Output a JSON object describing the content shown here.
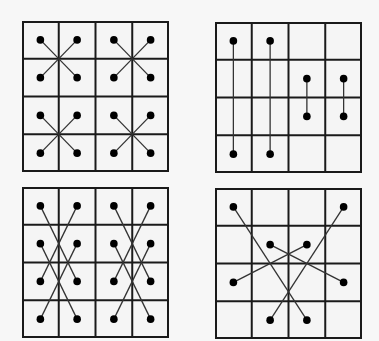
{
  "diagram": {
    "colors": {
      "background": "#f7f7f7",
      "cell_fill": "#f5f5f5",
      "grid_line": "#1a1a1a",
      "connector": "#333333",
      "dot": "#000000"
    },
    "grid": {
      "rows": 4,
      "cols": 4
    },
    "panels": [
      {
        "id": "top-left",
        "pattern": "crossing-X-pairs-within-2x2-blocks",
        "dots": [
          [
            0,
            0
          ],
          [
            1,
            0
          ],
          [
            2,
            0
          ],
          [
            3,
            0
          ],
          [
            0,
            1
          ],
          [
            1,
            1
          ],
          [
            2,
            1
          ],
          [
            3,
            1
          ],
          [
            0,
            2
          ],
          [
            1,
            2
          ],
          [
            2,
            2
          ],
          [
            3,
            2
          ],
          [
            0,
            3
          ],
          [
            1,
            3
          ],
          [
            2,
            3
          ],
          [
            3,
            3
          ]
        ],
        "edges": [
          [
            [
              0,
              0
            ],
            [
              1,
              1
            ]
          ],
          [
            [
              1,
              0
            ],
            [
              0,
              1
            ]
          ],
          [
            [
              2,
              0
            ],
            [
              3,
              1
            ]
          ],
          [
            [
              3,
              0
            ],
            [
              2,
              1
            ]
          ],
          [
            [
              0,
              2
            ],
            [
              1,
              3
            ]
          ],
          [
            [
              1,
              2
            ],
            [
              0,
              3
            ]
          ],
          [
            [
              2,
              2
            ],
            [
              3,
              3
            ]
          ],
          [
            [
              3,
              2
            ],
            [
              2,
              3
            ]
          ]
        ]
      },
      {
        "id": "top-right",
        "pattern": "vertical-pairs",
        "dots": [
          [
            0,
            0
          ],
          [
            1,
            0
          ],
          [
            2,
            1
          ],
          [
            3,
            1
          ],
          [
            2,
            2
          ],
          [
            3,
            2
          ],
          [
            0,
            3
          ],
          [
            1,
            3
          ]
        ],
        "edges": [
          [
            [
              0,
              0
            ],
            [
              0,
              3
            ]
          ],
          [
            [
              1,
              0
            ],
            [
              1,
              3
            ]
          ],
          [
            [
              2,
              1
            ],
            [
              2,
              2
            ]
          ],
          [
            [
              3,
              1
            ],
            [
              3,
              2
            ]
          ]
        ]
      },
      {
        "id": "bottom-left",
        "pattern": "crossing-pairs-skip-one-row",
        "dots": [
          [
            0,
            0
          ],
          [
            1,
            0
          ],
          [
            2,
            0
          ],
          [
            3,
            0
          ],
          [
            0,
            1
          ],
          [
            1,
            1
          ],
          [
            2,
            1
          ],
          [
            3,
            1
          ],
          [
            0,
            2
          ],
          [
            1,
            2
          ],
          [
            2,
            2
          ],
          [
            3,
            2
          ],
          [
            0,
            3
          ],
          [
            1,
            3
          ],
          [
            2,
            3
          ],
          [
            3,
            3
          ]
        ],
        "edges": [
          [
            [
              0,
              0
            ],
            [
              1,
              2
            ]
          ],
          [
            [
              1,
              0
            ],
            [
              0,
              2
            ]
          ],
          [
            [
              0,
              1
            ],
            [
              1,
              3
            ]
          ],
          [
            [
              1,
              1
            ],
            [
              0,
              3
            ]
          ],
          [
            [
              2,
              0
            ],
            [
              3,
              2
            ]
          ],
          [
            [
              3,
              0
            ],
            [
              2,
              2
            ]
          ],
          [
            [
              2,
              1
            ],
            [
              3,
              3
            ]
          ],
          [
            [
              3,
              1
            ],
            [
              2,
              3
            ]
          ]
        ]
      },
      {
        "id": "bottom-right",
        "pattern": "long-crossing-pairs",
        "dots": [
          [
            0,
            0
          ],
          [
            3,
            0
          ],
          [
            1,
            1
          ],
          [
            2,
            1
          ],
          [
            0,
            2
          ],
          [
            3,
            2
          ],
          [
            1,
            3
          ],
          [
            2,
            3
          ]
        ],
        "edges": [
          [
            [
              0,
              0
            ],
            [
              2,
              3
            ]
          ],
          [
            [
              3,
              0
            ],
            [
              1,
              3
            ]
          ],
          [
            [
              1,
              1
            ],
            [
              3,
              2
            ]
          ],
          [
            [
              2,
              1
            ],
            [
              0,
              2
            ]
          ]
        ]
      }
    ]
  }
}
